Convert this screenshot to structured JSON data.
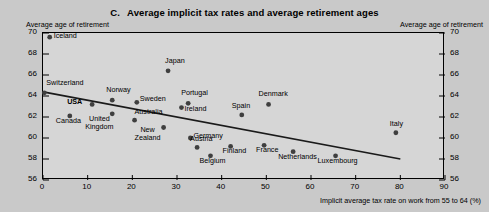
{
  "figure": {
    "panel_letter": "C.",
    "title": "Average implicit tax rates and average retirement ages",
    "left_axis_caption": "Average age of retirement",
    "right_axis_caption": "Average age of retirement",
    "xaxis_title": "Implicit average tax rate on work from 55 to 64 (%)"
  },
  "colors": {
    "background": "#c9c9c9",
    "plot_background": "#d6d6d6",
    "marker": "#3f3f3f",
    "axis": "#000000",
    "trendline": "#1a1a1a"
  },
  "chart_data": {
    "type": "scatter",
    "title": "Average implicit tax rates and average retirement ages",
    "xlabel": "Implicit average tax rate on work from 55 to 64 (%)",
    "ylabel": "Average age of retirement",
    "xlim": [
      0,
      90
    ],
    "ylim": [
      56,
      70
    ],
    "xticks": [
      0,
      10,
      20,
      30,
      40,
      50,
      60,
      70,
      80,
      90
    ],
    "yticks": [
      56,
      58,
      60,
      62,
      64,
      66,
      68,
      70
    ],
    "grid": false,
    "legend": null,
    "points": [
      {
        "name": "Iceland",
        "x": 1.5,
        "y": 69.6,
        "label_dx": 5,
        "label_dy": -4,
        "bold": false
      },
      {
        "name": "Japan",
        "x": 28.0,
        "y": 66.4,
        "label_dx": -2,
        "label_dy": -13,
        "bold": false
      },
      {
        "name": "Switzerland",
        "x": 0.3,
        "y": 64.3,
        "label_dx": 3,
        "label_dy": -13,
        "bold": false
      },
      {
        "name": "Norway",
        "x": 15.5,
        "y": 63.6,
        "label_dx": -5,
        "label_dy": -13,
        "bold": false
      },
      {
        "name": "USA",
        "x": 11.0,
        "y": 63.2,
        "label_dx": -24,
        "label_dy": -5,
        "bold": true
      },
      {
        "name": "Sweden",
        "x": 21.0,
        "y": 63.4,
        "label_dx": 4,
        "label_dy": -6,
        "bold": false
      },
      {
        "name": "Portugal",
        "x": 32.5,
        "y": 63.3,
        "label_dx": -6,
        "label_dy": -13,
        "bold": false
      },
      {
        "name": "Ireland",
        "x": 31.0,
        "y": 62.9,
        "label_dx": 4,
        "label_dy": -2,
        "bold": false
      },
      {
        "name": "Denmark",
        "x": 50.5,
        "y": 63.2,
        "label_dx": -9,
        "label_dy": -13,
        "bold": false
      },
      {
        "name": "Canada",
        "x": 6.0,
        "y": 62.1,
        "label_dx": -13,
        "label_dy": 2,
        "bold": false
      },
      {
        "name": "United Kingdom",
        "x": 15.5,
        "y": 62.3,
        "label_dx": -18,
        "label_dy": 2,
        "bold": false
      },
      {
        "name": "Australia",
        "x": 20.5,
        "y": 61.7,
        "label_dx": 1,
        "label_dy": -11,
        "bold": false
      },
      {
        "name": "Spain",
        "x": 44.5,
        "y": 62.2,
        "label_dx": -9,
        "label_dy": -12,
        "bold": false
      },
      {
        "name": "New Zealand",
        "x": 27.0,
        "y": 61.0,
        "label_dx": -20,
        "label_dy": -1,
        "bold": false
      },
      {
        "name": "Italy",
        "x": 79.0,
        "y": 60.5,
        "label_dx": -5,
        "label_dy": -12,
        "bold": false
      },
      {
        "name": "Germany",
        "x": 33.0,
        "y": 60.0,
        "label_dx": 4,
        "label_dy": -5,
        "bold": false
      },
      {
        "name": "Austria",
        "x": 34.5,
        "y": 59.1,
        "label_dx": -6,
        "label_dy": -11,
        "bold": false
      },
      {
        "name": "Finland",
        "x": 42.0,
        "y": 59.2,
        "label_dx": -7,
        "label_dy": 2,
        "bold": false
      },
      {
        "name": "France",
        "x": 49.5,
        "y": 59.3,
        "label_dx": -7,
        "label_dy": 2,
        "bold": false
      },
      {
        "name": "Netherlands",
        "x": 56.0,
        "y": 58.7,
        "label_dx": -14,
        "label_dy": 2,
        "bold": false
      },
      {
        "name": "Luxembourg",
        "x": 65.5,
        "y": 58.3,
        "label_dx": -17,
        "label_dy": 2,
        "bold": false
      },
      {
        "name": "Belgium",
        "x": 37.5,
        "y": 58.3,
        "label_dx": -10,
        "label_dy": 2,
        "bold": false
      }
    ],
    "trendline": {
      "x0": 0.0,
      "y0": 64.4,
      "x1": 80.0,
      "y1": 58.0
    }
  }
}
